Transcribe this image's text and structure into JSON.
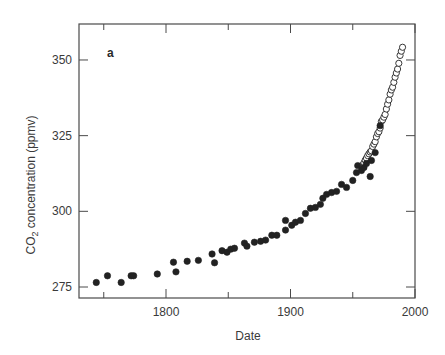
{
  "chart_data": {
    "type": "scatter",
    "title": "",
    "panel_label": "a",
    "xlabel": "Date",
    "ylabel": "CO2 concentration (ppmv)",
    "ylabel_main": "CO",
    "ylabel_sub": "2",
    "ylabel_rest": " concentration (ppmv)",
    "xlim": [
      1730,
      2000
    ],
    "ylim": [
      272,
      362
    ],
    "x_ticks": [
      1750,
      1800,
      1850,
      1900,
      1950,
      2000
    ],
    "x_tick_labels": [
      {
        "value": 1800,
        "label": "1800"
      },
      {
        "value": 1900,
        "label": "1900"
      },
      {
        "value": 2000,
        "label": "2000"
      }
    ],
    "y_ticks": [
      275,
      300,
      325,
      350
    ],
    "y_tick_labels": [
      "275",
      "300",
      "325",
      "350"
    ],
    "grid": false,
    "legend": null,
    "series": [
      {
        "name": "Ice core (filled circles)",
        "marker": "filled-circle",
        "color": "#222222",
        "points": [
          [
            1744,
            276.5
          ],
          [
            1753,
            278.7
          ],
          [
            1764,
            276.5
          ],
          [
            1772,
            278.7
          ],
          [
            1774,
            278.7
          ],
          [
            1793,
            279.3
          ],
          [
            1806,
            283.2
          ],
          [
            1808,
            280.0
          ],
          [
            1817,
            283.5
          ],
          [
            1826,
            283.8
          ],
          [
            1837,
            285.9
          ],
          [
            1839,
            283.0
          ],
          [
            1845,
            287.0
          ],
          [
            1849,
            286.5
          ],
          [
            1852,
            287.5
          ],
          [
            1855,
            287.8
          ],
          [
            1863,
            289.5
          ],
          [
            1865,
            288.5
          ],
          [
            1871,
            289.8
          ],
          [
            1876,
            290.1
          ],
          [
            1880,
            290.5
          ],
          [
            1885,
            292.1
          ],
          [
            1889,
            292.1
          ],
          [
            1896,
            293.8
          ],
          [
            1896,
            297.0
          ],
          [
            1901,
            295.4
          ],
          [
            1904,
            296.4
          ],
          [
            1908,
            297.0
          ],
          [
            1912,
            299.3
          ],
          [
            1916,
            301.0
          ],
          [
            1920,
            301.3
          ],
          [
            1924,
            302.3
          ],
          [
            1926,
            304.3
          ],
          [
            1929,
            305.6
          ],
          [
            1933,
            306.2
          ],
          [
            1937,
            306.6
          ],
          [
            1941,
            308.9
          ],
          [
            1945,
            307.9
          ],
          [
            1950,
            310.2
          ],
          [
            1953,
            312.8
          ],
          [
            1954,
            315.1
          ],
          [
            1957,
            313.5
          ],
          [
            1959,
            314.5
          ],
          [
            1961,
            315.8
          ],
          [
            1964,
            311.5
          ],
          [
            1965,
            316.8
          ],
          [
            1968,
            319.4
          ],
          [
            1972,
            328.3
          ]
        ]
      },
      {
        "name": "Atmospheric measurements (open circles)",
        "marker": "open-circle",
        "color": "#222222",
        "points": [
          [
            1958,
            315.3
          ],
          [
            1959,
            316.0
          ],
          [
            1960,
            316.9
          ],
          [
            1961,
            317.6
          ],
          [
            1962,
            318.4
          ],
          [
            1963,
            319.0
          ],
          [
            1964,
            319.6
          ],
          [
            1965,
            320.0
          ],
          [
            1966,
            321.4
          ],
          [
            1967,
            322.2
          ],
          [
            1968,
            323.0
          ],
          [
            1969,
            324.6
          ],
          [
            1970,
            325.7
          ],
          [
            1971,
            326.3
          ],
          [
            1972,
            327.5
          ],
          [
            1973,
            329.7
          ],
          [
            1974,
            330.2
          ],
          [
            1975,
            331.1
          ],
          [
            1976,
            332.0
          ],
          [
            1977,
            333.8
          ],
          [
            1978,
            335.4
          ],
          [
            1979,
            336.8
          ],
          [
            1980,
            338.7
          ],
          [
            1981,
            340.1
          ],
          [
            1982,
            341.0
          ],
          [
            1983,
            342.6
          ],
          [
            1984,
            344.3
          ],
          [
            1985,
            345.7
          ],
          [
            1986,
            347.0
          ],
          [
            1987,
            348.9
          ],
          [
            1988,
            351.5
          ],
          [
            1989,
            352.9
          ],
          [
            1990,
            354.2
          ]
        ]
      }
    ]
  }
}
